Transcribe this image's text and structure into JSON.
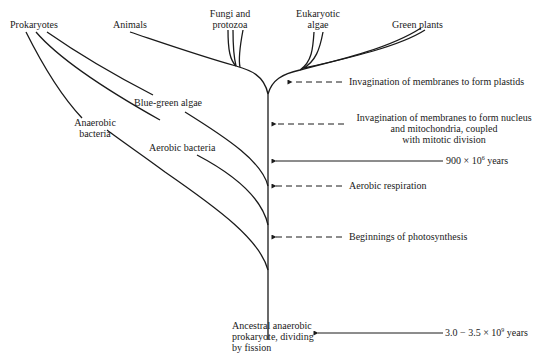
{
  "diagram": {
    "type": "evolutionary-tree",
    "root": "Ancestral anaerobic prokaryote, dividing by fission",
    "branches": {
      "prokaryotes": "Prokaryotes",
      "animals": "Animals",
      "fungi_l1": "Fungi and",
      "fungi_l2": "protozoa",
      "euk_l1": "Eukaryotic",
      "euk_l2": "algae",
      "green_plants": "Green plants",
      "blue_green": "Blue-green algae",
      "anaerobic_l1": "Anaerobic",
      "anaerobic_l2": "bacteria",
      "aerobic": "Aerobic bacteria",
      "root_l1": "Ancestral anaerobic",
      "root_l2": "prokaryote, dividing",
      "root_l3": "by fission"
    },
    "events": {
      "plastids": "Invagination of membranes to form plastids",
      "nucleus_l1": "Invagination of membranes to form nucleus",
      "nucleus_l2": "and mitochondria, coupled",
      "nucleus_l3": "with mitotic division",
      "aerobic_resp": "Aerobic respiration",
      "photosynthesis": "Beginnings of photosynthesis"
    },
    "timescale": {
      "t900_prefix": "900 × 10",
      "t900_exp": "6",
      "t900_suffix": " years",
      "t3_prefix": "3.0 − 3.5 × 10",
      "t3_exp": "9",
      "t3_suffix": " years"
    }
  }
}
